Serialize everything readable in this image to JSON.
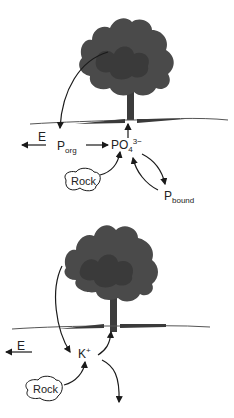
{
  "colors": {
    "tree": "#4a4a4a",
    "tree_dark": "#333333",
    "ground": "#555555",
    "arrow": "#1a1a1a",
    "background": "#ffffff"
  },
  "panels": [
    {
      "name": "phosphorus-cycle",
      "labels": {
        "export": "E",
        "organic_p": "P",
        "organic_p_sub": "org",
        "phosphate": "PO",
        "phosphate_sub": "4",
        "phosphate_sup": "3−",
        "rock": "Rock",
        "bound_p": "P",
        "bound_p_sub": "bound"
      }
    },
    {
      "name": "potassium-cycle",
      "labels": {
        "export": "E",
        "potassium": "K",
        "potassium_sup": "+",
        "rock": "Rock"
      }
    }
  ]
}
